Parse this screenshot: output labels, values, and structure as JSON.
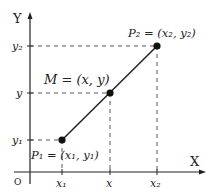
{
  "diagram": {
    "axes": {
      "x_label": "X",
      "y_label": "Y",
      "origin_label": "O"
    },
    "x_ticks": [
      "x1",
      "x",
      "x2"
    ],
    "y_ticks": [
      "y2",
      "y",
      "y1"
    ],
    "points": [
      {
        "name": "P1",
        "label": "P₁ = (x₁, y₁)"
      },
      {
        "name": "M",
        "label": "M = (x, y)"
      },
      {
        "name": "P2",
        "label": "P₂ = (x₂, y₂)"
      }
    ],
    "tick_labels": {
      "x1": "x₁",
      "x": "x",
      "x2": "x₂",
      "y1": "y₁",
      "y": "y",
      "y2": "y₂"
    },
    "colors": {
      "line": "#222222",
      "dash": "#444444"
    }
  }
}
